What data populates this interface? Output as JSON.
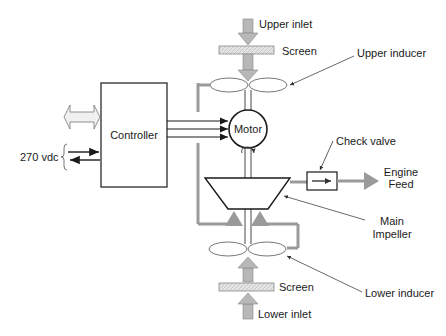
{
  "diagram": {
    "type": "pump system schematic",
    "labels": {
      "upper_inlet": "Upper inlet",
      "upper_screen": "Screen",
      "upper_inducer": "Upper inducer",
      "controller": "Controller",
      "motor": "Motor",
      "check_valve": "Check valve",
      "engine_feed_line1": "Engine",
      "engine_feed_line2": "Feed",
      "main_impeller_line1": "Main",
      "main_impeller_line2": "Impeller",
      "lower_inducer": "Lower inducer",
      "lower_screen": "Screen",
      "lower_inlet": "Lower inlet",
      "power_input": "270 vdc"
    },
    "colors": {
      "line": "#1a1a1a",
      "flow_gray": "#9a9a9a",
      "arrow_fill": "#b8b8b8",
      "screen_fill": "#e2e2e2",
      "bidirectional_fill": "#f0f0f0"
    }
  }
}
